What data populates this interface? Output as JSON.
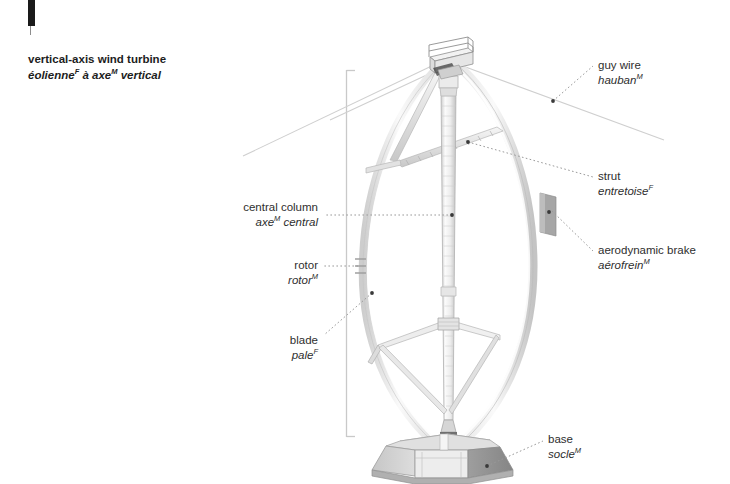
{
  "figure": {
    "title_en": "vertical-axis wind turbine",
    "title_fr_parts": [
      "éolienne",
      "F",
      " à axe",
      "M",
      " vertical"
    ],
    "title_fr_plain": "éolienne F à axe M vertical"
  },
  "labels": [
    {
      "id": "guy-wire",
      "en": "guy wire",
      "fr_stem": "hauban",
      "fr_sup": "M",
      "align": "left",
      "x": 598,
      "y": 58
    },
    {
      "id": "strut",
      "en": "strut",
      "fr_stem": "entretoise",
      "fr_sup": "F",
      "align": "left",
      "x": 598,
      "y": 169
    },
    {
      "id": "aerodynamic-brake",
      "en": "aerodynamic brake",
      "fr_stem": "aérofrein",
      "fr_sup": "M",
      "align": "left",
      "x": 598,
      "y": 243
    },
    {
      "id": "base",
      "en": "base",
      "fr_stem": "socle",
      "fr_sup": "M",
      "align": "left",
      "x": 548,
      "y": 432
    },
    {
      "id": "central-column",
      "en": "central column",
      "fr_stem": "axe",
      "fr_sup": "M",
      "fr_tail": " central",
      "align": "right",
      "x": 318,
      "y": 200
    },
    {
      "id": "rotor",
      "en": "rotor",
      "fr_stem": "rotor",
      "fr_sup": "M",
      "align": "right",
      "x": 318,
      "y": 258
    },
    {
      "id": "blade",
      "en": "blade",
      "fr_stem": "pale",
      "fr_sup": "F",
      "align": "right",
      "x": 318,
      "y": 333
    }
  ],
  "colors": {
    "text": "#2e2e2e",
    "title": "#1d1d1d",
    "leader": "#9a9a9a",
    "dot": "#3a3a3a",
    "bracket": "#c9c9c9",
    "blade": "#e8e8e8",
    "blade_edge": "#bdbdbd",
    "column": "#f0f0f0",
    "column_edge": "#b5b5b5",
    "base_light": "#d8d8d8",
    "base_mid": "#b8b8b8",
    "base_dark": "#9a9a9a",
    "brake": "#a8a8a8",
    "page_mark": "#1a1a1a"
  },
  "art": {
    "bracket": {
      "x": 346,
      "top": 70,
      "bottom": 437,
      "tick": 9
    },
    "leader_dots": [
      {
        "id": "guy-wire-dot",
        "x": 553,
        "y": 101
      },
      {
        "id": "strut-dot",
        "x": 468,
        "y": 142
      },
      {
        "id": "aerodynamic-brake-dot",
        "x": 552,
        "y": 211
      },
      {
        "id": "base-dot",
        "x": 487,
        "y": 466
      },
      {
        "id": "central-column-dot",
        "x": 452,
        "y": 215
      },
      {
        "id": "blade-dot",
        "x": 372,
        "y": 293
      }
    ]
  }
}
